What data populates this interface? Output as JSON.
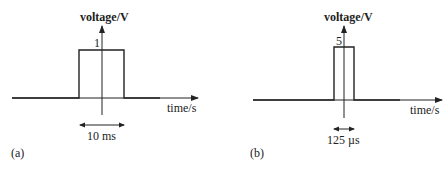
{
  "figure": {
    "panels": [
      {
        "id": "a",
        "panel_label": "(a)",
        "y_axis_label": "voltage/V",
        "x_axis_label": "time/s",
        "amplitude_label": "1",
        "width_label": "10 ms"
      },
      {
        "id": "b",
        "panel_label": "(b)",
        "y_axis_label": "voltage/V",
        "x_axis_label": "time/s",
        "amplitude_label": "5",
        "width_label": "125 µs"
      }
    ]
  },
  "colors": {
    "line": "#222222",
    "background": "#ffffff"
  }
}
